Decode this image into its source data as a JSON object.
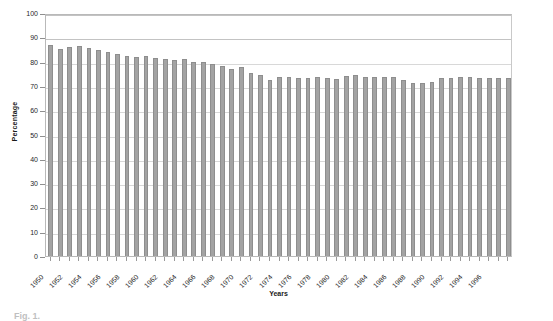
{
  "chart_data": {
    "type": "bar",
    "title": "",
    "xlabel": "Years",
    "ylabel": "Percentage",
    "ylim": [
      0,
      100
    ],
    "ytick_step": 10,
    "yticks": [
      "100",
      "90",
      "80",
      "70",
      "60",
      "50",
      "40",
      "30",
      "20",
      "10",
      "0"
    ],
    "grid": true,
    "legend": "none",
    "bar_color": "#a3a3a3",
    "bar_edge_color": "#8e8e8e",
    "categories": [
      "1950",
      "1951",
      "1952",
      "1953",
      "1954",
      "1955",
      "1956",
      "1957",
      "1958",
      "1959",
      "1960",
      "1961",
      "1962",
      "1963",
      "1964",
      "1965",
      "1966",
      "1967",
      "1968",
      "1969",
      "1970",
      "1971",
      "1972",
      "1973",
      "1974",
      "1975",
      "1976",
      "1977",
      "1978",
      "1979",
      "1980",
      "1981",
      "1982",
      "1983",
      "1984",
      "1985",
      "1986",
      "1987",
      "1988",
      "1989",
      "1990",
      "1991",
      "1992",
      "1993",
      "1994",
      "1995",
      "1996",
      "1997",
      "1998"
    ],
    "visible_tick_labels": [
      "1950",
      "1952",
      "1954",
      "1956",
      "1958",
      "1960",
      "1962",
      "1964",
      "1966",
      "1968",
      "1970",
      "1972",
      "1974",
      "1976",
      "1978",
      "1980",
      "1982",
      "1984",
      "1986",
      "1988",
      "1990",
      "1992",
      "1994",
      "1996"
    ],
    "values": [
      87.0,
      85.2,
      86.2,
      86.6,
      85.6,
      84.8,
      83.8,
      83.2,
      82.2,
      81.8,
      82.4,
      81.4,
      80.9,
      80.8,
      80.9,
      79.8,
      80.0,
      79.0,
      78.3,
      77.1,
      77.6,
      75.4,
      74.6,
      72.6,
      73.6,
      73.8,
      73.2,
      73.1,
      73.5,
      73.4,
      73.0,
      74.0,
      74.6,
      73.6,
      73.8,
      73.6,
      73.5,
      72.6,
      71.2,
      71.4,
      71.6,
      73.2,
      73.4,
      73.8,
      73.6,
      73.4,
      73.4,
      73.2,
      73.3
    ]
  },
  "caption": {
    "text": "Fig. 1."
  }
}
